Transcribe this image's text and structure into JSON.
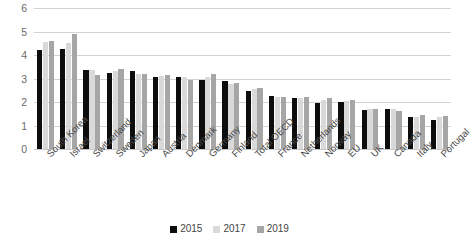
{
  "chart_data": {
    "type": "bar",
    "title": "",
    "subtitle": "",
    "xlabel": "",
    "ylabel": "",
    "ylim": [
      0,
      6
    ],
    "yticks": [
      0,
      1,
      2,
      3,
      4,
      5,
      6
    ],
    "ytick_labels": [
      "0",
      "1",
      "2",
      "3",
      "4",
      "5",
      "6"
    ],
    "grid": "horizontal",
    "legend_position": "bottom-center",
    "orientation": "vertical",
    "bar_group_mode": "grouped",
    "categories": [
      "South Korea",
      "Israel",
      "Switzerland",
      "Sweden",
      "Japan",
      "Austria",
      "Denmark",
      "Germany",
      "Finland",
      "Total OECD",
      "France",
      "Netherlands",
      "Norway",
      "EU",
      "UK",
      "Canada",
      "Italy",
      "Portugal"
    ],
    "series": [
      {
        "name": "2015",
        "color": "#0D0D0D",
        "values": [
          4.2,
          4.25,
          3.35,
          3.25,
          3.3,
          3.05,
          3.05,
          2.95,
          2.9,
          2.45,
          2.25,
          2.15,
          1.95,
          2.0,
          1.65,
          1.7,
          1.35,
          1.25
        ]
      },
      {
        "name": "2017",
        "color": "#D9D9D9",
        "values": [
          4.55,
          4.5,
          3.35,
          3.3,
          3.2,
          3.1,
          3.05,
          3.05,
          2.75,
          2.55,
          2.2,
          2.15,
          2.1,
          2.05,
          1.7,
          1.7,
          1.35,
          1.35
        ]
      },
      {
        "name": "2019",
        "color": "#A6A6A6",
        "values": [
          4.6,
          4.9,
          3.15,
          3.4,
          3.2,
          3.15,
          2.95,
          3.2,
          2.8,
          2.6,
          2.2,
          2.2,
          2.15,
          2.1,
          1.7,
          1.6,
          1.45,
          1.4
        ]
      }
    ]
  },
  "legend": {
    "items": [
      {
        "label": "2015",
        "color": "#0D0D0D"
      },
      {
        "label": "2017",
        "color": "#D9D9D9"
      },
      {
        "label": "2019",
        "color": "#A6A6A6"
      }
    ]
  }
}
